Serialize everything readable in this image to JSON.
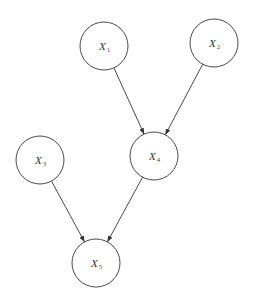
{
  "diagram": {
    "type": "directed-acyclic-graph",
    "colors": {
      "stroke": "#4a4a4a",
      "text": "#333333",
      "background": "#ffffff"
    },
    "nodes": [
      {
        "id": "X1",
        "var": "X",
        "sub": "1",
        "cx": 104,
        "cy": 46,
        "r": 24
      },
      {
        "id": "X2",
        "var": "X",
        "sub": "2",
        "cx": 214,
        "cy": 43,
        "r": 24
      },
      {
        "id": "X3",
        "var": "X",
        "sub": "3",
        "cx": 40,
        "cy": 160,
        "r": 24
      },
      {
        "id": "X4",
        "var": "X",
        "sub": "4",
        "cx": 154,
        "cy": 156,
        "r": 24
      },
      {
        "id": "X5",
        "var": "X",
        "sub": "5",
        "cx": 96,
        "cy": 263,
        "r": 24
      }
    ],
    "edges": [
      {
        "from": "X1",
        "to": "X4"
      },
      {
        "from": "X2",
        "to": "X4"
      },
      {
        "from": "X3",
        "to": "X5"
      },
      {
        "from": "X4",
        "to": "X5"
      }
    ]
  }
}
